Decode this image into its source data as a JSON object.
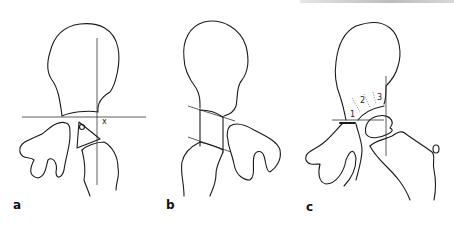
{
  "figure": {
    "panels": [
      {
        "id": "a",
        "label": "a",
        "annotations": [
          "x"
        ]
      },
      {
        "id": "b",
        "label": "b",
        "annotations": []
      },
      {
        "id": "c",
        "label": "c",
        "annotations": [
          "1",
          "2",
          "3"
        ]
      }
    ]
  }
}
